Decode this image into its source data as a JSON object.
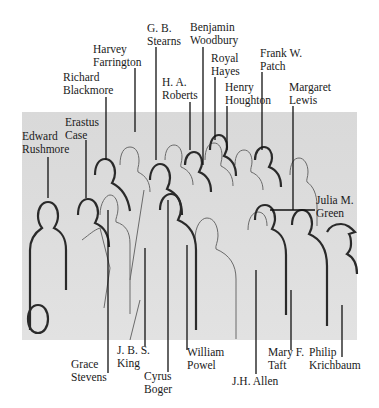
{
  "diagram": {
    "type": "identification key",
    "colors": {
      "panel": "#dcdcdc",
      "outline": "#2a2a2a",
      "leader": "#111111",
      "text": "#1a1a1a"
    },
    "top_labels": [
      {
        "id": "edward-rushmore",
        "line1": "Edward",
        "line2": "Rushmore"
      },
      {
        "id": "erastus-case",
        "line1": "Erastus",
        "line2": "Case"
      },
      {
        "id": "richard-blackmore",
        "line1": "Richard",
        "line2": "Blackmore"
      },
      {
        "id": "harvey-farrington",
        "line1": "Harvey",
        "line2": "Farrington"
      },
      {
        "id": "gb-stearns",
        "line1": "G. B.",
        "line2": "Stearns"
      },
      {
        "id": "ha-roberts",
        "line1": "H. A.",
        "line2": "Roberts"
      },
      {
        "id": "benjamin-woodbury",
        "line1": "Benjamin",
        "line2": "Woodbury"
      },
      {
        "id": "royal-hayes",
        "line1": "Royal",
        "line2": "Hayes"
      },
      {
        "id": "henry-houghton",
        "line1": "Henry",
        "line2": "Houghton"
      },
      {
        "id": "frank-w-patch",
        "line1": "Frank W.",
        "line2": "Patch"
      },
      {
        "id": "margaret-lewis",
        "line1": "Margaret",
        "line2": "Lewis"
      },
      {
        "id": "julia-m-green",
        "line1": "Julia M.",
        "line2": "Green"
      }
    ],
    "bottom_labels": [
      {
        "id": "grace-stevens",
        "line1": "Grace",
        "line2": "Stevens"
      },
      {
        "id": "jbs-king",
        "line1": "J. B. S.",
        "line2": "King"
      },
      {
        "id": "cyrus-boger",
        "line1": "Cyrus",
        "line2": "Boger"
      },
      {
        "id": "william-powel",
        "line1": "William",
        "line2": "Powel"
      },
      {
        "id": "jh-allen",
        "line1": "J.H. Allen",
        "line2": ""
      },
      {
        "id": "mary-f-taft",
        "line1": "Mary F.",
        "line2": "Taft"
      },
      {
        "id": "philip-krichbaum",
        "line1": "Philip",
        "line2": "Krichbaum"
      }
    ]
  }
}
